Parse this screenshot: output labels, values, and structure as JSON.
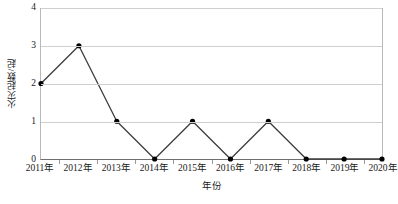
{
  "chart_data": {
    "type": "line",
    "title": "",
    "subtitle": "",
    "xlabel": "年份",
    "ylabel": "火灾起数/起",
    "categories": [
      "2011年",
      "2012年",
      "2013年",
      "2014年",
      "2015年",
      "2016年",
      "2017年",
      "2018年",
      "2019年",
      "2020年"
    ],
    "values": [
      2,
      3,
      1,
      0,
      1,
      0,
      1,
      0,
      0,
      0
    ],
    "series": [
      {
        "name": "火灾起数",
        "values": [
          2,
          3,
          1,
          0,
          1,
          0,
          1,
          0,
          0,
          0
        ]
      }
    ],
    "ylim": [
      0,
      4
    ],
    "y_ticks": [
      "0",
      "1",
      "2",
      "3",
      "4"
    ],
    "y_tick_values": [
      0,
      1,
      2,
      3,
      4
    ],
    "grid": "horizontal",
    "legend": "none",
    "marker": "filled-circle",
    "line_color": "#3d3d3d",
    "marker_color": "#000000",
    "grid_color": "#cfcfcf",
    "axis_color": "#6f6f6f",
    "background": "#ffffff"
  }
}
